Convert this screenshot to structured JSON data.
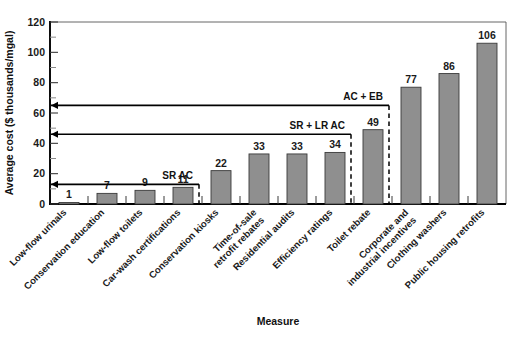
{
  "chart_data": {
    "type": "bar",
    "title": "",
    "xlabel": "Measure",
    "ylabel": "Average cost ($ thousands/mgal)",
    "ylim": [
      0,
      120
    ],
    "yticks": [
      0,
      20,
      40,
      60,
      80,
      100,
      120
    ],
    "ytick_labels": [
      "0",
      "20",
      "40",
      "60",
      "80",
      "100",
      "120"
    ],
    "y_minor_ticks": [
      10,
      30,
      50,
      70,
      90,
      110
    ],
    "grid": false,
    "legend": "none",
    "categories": [
      "Low-flow urinals",
      "Conservation education",
      "Low-flow toilets",
      "Car-wash certifications",
      "Conservation kiosks",
      "Time-of-sale retrofit rebates",
      "Residential audits",
      "Efficiency ratings",
      "Toilet rebate",
      "Corporate and industrial incentives",
      "Clothing washers",
      "Public housing retrofits"
    ],
    "category_lines": [
      [
        "Low-flow urinals"
      ],
      [
        "Conservation education"
      ],
      [
        "Low-flow toilets"
      ],
      [
        "Car-wash certifications"
      ],
      [
        "Conservation kiosks"
      ],
      [
        "Time-of-sale",
        "retrofit rebates"
      ],
      [
        "Residential audits"
      ],
      [
        "Efficiency ratings"
      ],
      [
        "Toilet rebate"
      ],
      [
        "Corporate and",
        "industrial incentives"
      ],
      [
        "Clothing washers"
      ],
      [
        "Public housing retrofits"
      ]
    ],
    "values": [
      1,
      7,
      9,
      11,
      22,
      33,
      33,
      34,
      49,
      77,
      86,
      106
    ],
    "data_labels": [
      "1",
      "7",
      "9",
      "11",
      "22",
      "33",
      "33",
      "34",
      "49",
      "77",
      "86",
      "106"
    ],
    "bar_color": "#8f8f8f",
    "annotations": [
      {
        "label": "SR AC",
        "level": 13,
        "span_end_category_index": 3
      },
      {
        "label": "SR + LR AC",
        "level": 46,
        "span_end_category_index": 7
      },
      {
        "label": "AC + EB",
        "level": 65,
        "span_end_category_index": 8
      }
    ]
  }
}
